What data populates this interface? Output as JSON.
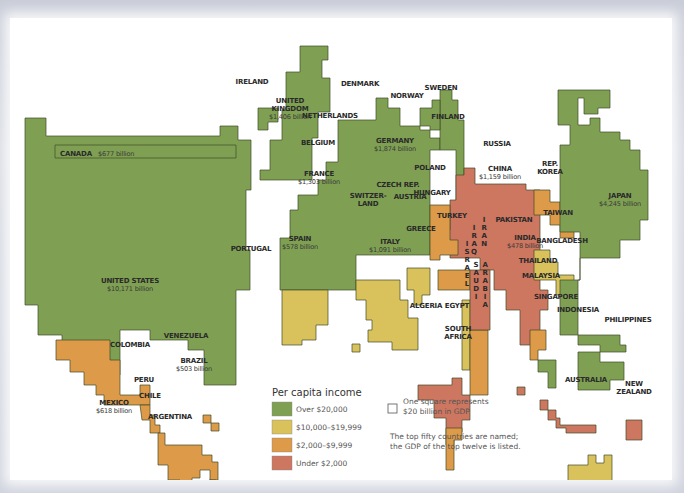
{
  "legend": {
    "title": "Per capita income",
    "categories": [
      {
        "key": "high",
        "label": "Over $20,000",
        "color": "#7fa052"
      },
      {
        "key": "uppermid",
        "label": "$10,000–$19,999",
        "color": "#d9c25c"
      },
      {
        "key": "lowermid",
        "label": "$2,000–$9,999",
        "color": "#dd9a48"
      },
      {
        "key": "low",
        "label": "Under $2,000",
        "color": "#cd7660"
      }
    ]
  },
  "scale_note": {
    "line1": "One square represents",
    "line2": "$20 billion in GDP"
  },
  "footnote": {
    "line1": "The top fifty countries are named;",
    "line2": "the GDP of the top twelve is listed."
  },
  "countries": [
    {
      "name": "CANADA",
      "gdp": "$677 billion",
      "category": "high",
      "label_inline": true
    },
    {
      "name": "UNITED STATES",
      "gdp": "$10,171 billion",
      "category": "high"
    },
    {
      "name": "MEXICO",
      "gdp": "$618 billion",
      "category": "lowermid"
    },
    {
      "name": "VENEZUELA",
      "category": "lowermid"
    },
    {
      "name": "COLOMBIA",
      "category": "low"
    },
    {
      "name": "BRAZIL",
      "gdp": "$503 billion",
      "category": "lowermid"
    },
    {
      "name": "PERU",
      "category": "low"
    },
    {
      "name": "CHILE",
      "category": "lowermid"
    },
    {
      "name": "ARGENTINA",
      "category": "lowermid"
    },
    {
      "name": "IRELAND",
      "category": "high"
    },
    {
      "name": "UNITED KINGDOM",
      "gdp": "$1,406 billion",
      "category": "high"
    },
    {
      "name": "DENMARK",
      "category": "high"
    },
    {
      "name": "NORWAY",
      "category": "high"
    },
    {
      "name": "SWEDEN",
      "category": "high"
    },
    {
      "name": "FINLAND",
      "category": "high"
    },
    {
      "name": "NETHERLANDS",
      "category": "high"
    },
    {
      "name": "BELGIUM",
      "category": "high"
    },
    {
      "name": "GERMANY",
      "gdp": "$1,874 billion",
      "category": "high"
    },
    {
      "name": "FRANCE",
      "gdp": "$1,303 billion",
      "category": "high"
    },
    {
      "name": "SWITZERLAND",
      "category": "high"
    },
    {
      "name": "AUSTRIA",
      "category": "high"
    },
    {
      "name": "CZECH REP.",
      "category": "lowermid"
    },
    {
      "name": "POLAND",
      "category": "lowermid"
    },
    {
      "name": "HUNGARY",
      "category": "lowermid"
    },
    {
      "name": "PORTUGAL",
      "category": "uppermid"
    },
    {
      "name": "SPAIN",
      "gdp": "$578 billion",
      "category": "uppermid"
    },
    {
      "name": "ITALY",
      "gdp": "$1,091 billion",
      "category": "high"
    },
    {
      "name": "GREECE",
      "category": "uppermid"
    },
    {
      "name": "TURKEY",
      "category": "lowermid"
    },
    {
      "name": "RUSSIA",
      "category": "lowermid"
    },
    {
      "name": "CHINA",
      "gdp": "$1,159 billion",
      "category": "low"
    },
    {
      "name": "REP. KOREA",
      "category": "lowermid"
    },
    {
      "name": "JAPAN",
      "gdp": "$4,245 billion",
      "category": "high"
    },
    {
      "name": "TAIWAN",
      "category": "uppermid"
    },
    {
      "name": "IRAQ",
      "category": "low"
    },
    {
      "name": "IRAN",
      "category": "low"
    },
    {
      "name": "ISRAEL",
      "category": "uppermid"
    },
    {
      "name": "SAUDI ARABIA",
      "category": "lowermid"
    },
    {
      "name": "PAKISTAN",
      "category": "low"
    },
    {
      "name": "INDIA",
      "gdp": "$478 billion",
      "category": "low"
    },
    {
      "name": "BANGLADESH",
      "category": "low"
    },
    {
      "name": "THAILAND",
      "category": "low"
    },
    {
      "name": "MALAYSIA",
      "category": "lowermid"
    },
    {
      "name": "SINGAPORE",
      "category": "high"
    },
    {
      "name": "INDONESIA",
      "category": "low"
    },
    {
      "name": "PHILIPPINES",
      "category": "low"
    },
    {
      "name": "ALGERIA",
      "category": "low"
    },
    {
      "name": "EGYPT",
      "category": "low"
    },
    {
      "name": "SOUTH AFRICA",
      "category": "lowermid"
    },
    {
      "name": "AUSTRALIA",
      "category": "uppermid"
    },
    {
      "name": "NEW ZEALAND",
      "category": "uppermid"
    }
  ]
}
